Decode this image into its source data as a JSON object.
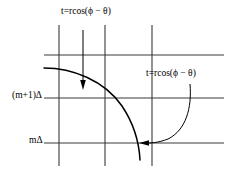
{
  "figure": {
    "name": "polar-projection-grid-diagram",
    "width": 232,
    "height": 183,
    "background_color": "#ffffff",
    "line_color": "#000000",
    "grid_color": "#3a3a3a"
  },
  "labels": {
    "top_equation": "t=rcos(ϕ − θ)",
    "right_equation": "t=rcos(ϕ − θ)",
    "y_axis_upper": "(m+1)Δ",
    "y_axis_lower": "mΔ"
  },
  "grid": {
    "horizontal_lines": [
      {
        "name": "grid-line-top",
        "y": 55,
        "x1": 44,
        "x2": 224
      },
      {
        "name": "grid-line-mplus1",
        "y": 98,
        "x1": 44,
        "x2": 224
      },
      {
        "name": "grid-line-m",
        "y": 143,
        "x1": 44,
        "x2": 224
      }
    ],
    "vertical_lines": [
      {
        "name": "grid-line-v1",
        "x": 59,
        "y1": 25,
        "y2": 166
      },
      {
        "name": "grid-line-v2",
        "x": 105,
        "y1": 25,
        "y2": 166
      },
      {
        "name": "grid-line-v3",
        "x": 152,
        "y1": 25,
        "y2": 166
      }
    ]
  },
  "curve": {
    "name": "projection-curve",
    "description": "descending concave curve crossing grid"
  },
  "arrows": {
    "down_arrow": {
      "name": "down-arrow",
      "x": 83,
      "y1": 30,
      "y2": 88
    },
    "curved_arrow": {
      "name": "curved-arrow",
      "tip_x": 140,
      "tip_y": 143
    }
  }
}
